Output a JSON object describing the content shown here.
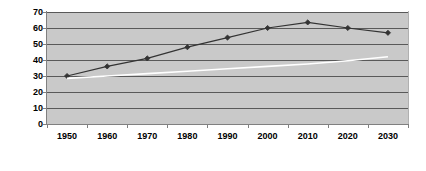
{
  "chart_data": {
    "type": "line",
    "title": "",
    "subtitle": "",
    "xlabel": "",
    "ylabel": "",
    "categories": [
      "1950",
      "1960",
      "1970",
      "1980",
      "1990",
      "2000",
      "2010",
      "2020",
      "2030"
    ],
    "ylim": [
      0,
      70
    ],
    "ytick_labels": [
      "0",
      "10",
      "20",
      "30",
      "40",
      "50",
      "60",
      "70"
    ],
    "ytick_values": [
      0,
      10,
      20,
      30,
      40,
      50,
      60,
      70
    ],
    "grid": "horizontal",
    "legend": "none",
    "plot_background": "#c9c9c9",
    "series": [
      {
        "name": "series-1",
        "color": "#333333",
        "marker": "diamond",
        "values": [
          30,
          36,
          41,
          48,
          54,
          60,
          63.5,
          60,
          57
        ]
      },
      {
        "name": "series-2",
        "color": "#ffffff",
        "marker": "none",
        "values": [
          28.5,
          30,
          31.5,
          33,
          34.5,
          36,
          37.5,
          39.5,
          42
        ]
      }
    ]
  }
}
